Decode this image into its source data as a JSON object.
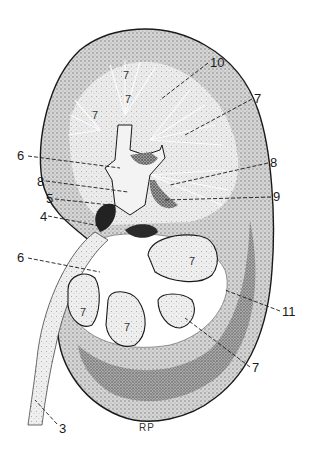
{
  "figure": {
    "colors": {
      "ink": "#1a1a1a",
      "paper": "#ffffff",
      "stipple": "#7a7a7a",
      "dark": "#2a2a2a"
    },
    "signature": "RP"
  },
  "labels": [
    {
      "id": "l10",
      "text": "10",
      "x": 210,
      "y": 56
    },
    {
      "id": "l7a",
      "text": "7",
      "x": 254,
      "y": 92
    },
    {
      "id": "l6a",
      "text": "6",
      "x": 17,
      "y": 149
    },
    {
      "id": "l8a",
      "text": "8",
      "x": 270,
      "y": 156
    },
    {
      "id": "l8b",
      "text": "8",
      "x": 37,
      "y": 175
    },
    {
      "id": "l5",
      "text": "5",
      "x": 46,
      "y": 192
    },
    {
      "id": "l9",
      "text": "9",
      "x": 273,
      "y": 190
    },
    {
      "id": "l4",
      "text": "4",
      "x": 40,
      "y": 210
    },
    {
      "id": "l6b",
      "text": "6",
      "x": 17,
      "y": 251
    },
    {
      "id": "l11",
      "text": "11",
      "x": 282,
      "y": 305
    },
    {
      "id": "l7b",
      "text": "7",
      "x": 252,
      "y": 361
    },
    {
      "id": "l3",
      "text": "3",
      "x": 59,
      "y": 422
    }
  ],
  "inner_labels": [
    {
      "text": "7",
      "x": 123,
      "y": 70
    },
    {
      "text": "7",
      "x": 92,
      "y": 110
    },
    {
      "text": "7",
      "x": 125,
      "y": 94
    },
    {
      "text": "7",
      "x": 189,
      "y": 256
    },
    {
      "text": "7",
      "x": 80,
      "y": 307
    },
    {
      "text": "7",
      "x": 124,
      "y": 322
    }
  ]
}
